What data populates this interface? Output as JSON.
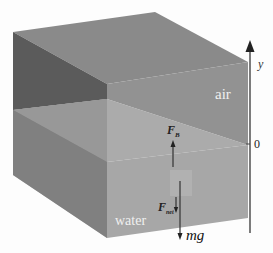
{
  "diagram": {
    "type": "buoyancy-free-body-diagram",
    "regions": {
      "air_label": "air",
      "water_label": "water"
    },
    "axis": {
      "name": "y",
      "origin_label": "0"
    },
    "forces": {
      "buoyant": {
        "symbol": "F",
        "subscript": "B",
        "direction": "up"
      },
      "net": {
        "symbol": "F",
        "subscript": "net",
        "direction": "down"
      },
      "weight": {
        "label": "mg",
        "direction": "down"
      }
    },
    "colors": {
      "background": "#fdfdfd",
      "top_face": "#8a8a8a",
      "left_air": "#5e5e5e",
      "left_water": "#858585",
      "front_air": "#8f8f8f",
      "front_water": "#a6a6a6",
      "water_surface": "#9e9e9e",
      "axis": "#444444",
      "label_light": "#f2f2f2",
      "label_dark": "#222222"
    }
  }
}
